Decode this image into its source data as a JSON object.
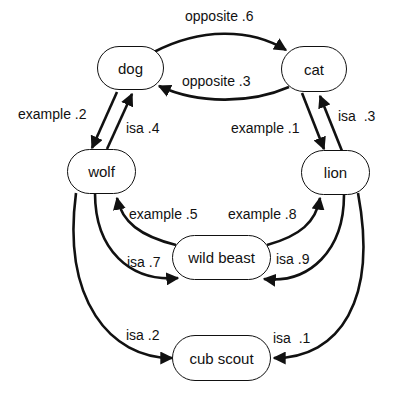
{
  "diagram": {
    "type": "semantic network",
    "nodes": [
      {
        "id": "dog",
        "label": "dog"
      },
      {
        "id": "cat",
        "label": "cat"
      },
      {
        "id": "wolf",
        "label": "wolf"
      },
      {
        "id": "lion",
        "label": "lion"
      },
      {
        "id": "wild_beast",
        "label": "wild beast"
      },
      {
        "id": "cub_scout",
        "label": "cub scout"
      }
    ],
    "edges": [
      {
        "from": "dog",
        "to": "cat",
        "relation": "opposite",
        "weight": ".6",
        "label": "opposite .6"
      },
      {
        "from": "cat",
        "to": "dog",
        "relation": "opposite",
        "weight": ".3",
        "label": "opposite .3"
      },
      {
        "from": "dog",
        "to": "wolf",
        "relation": "example",
        "weight": ".2",
        "label": "example .2"
      },
      {
        "from": "wolf",
        "to": "dog",
        "relation": "isa",
        "weight": ".4",
        "label": "isa .4"
      },
      {
        "from": "cat",
        "to": "lion",
        "relation": "example",
        "weight": ".1",
        "label": "example .1"
      },
      {
        "from": "lion",
        "to": "cat",
        "relation": "isa",
        "weight": ".3",
        "label": "isa  .3"
      },
      {
        "from": "wild_beast",
        "to": "wolf",
        "relation": "example",
        "weight": ".5",
        "label": "example .5"
      },
      {
        "from": "wild_beast",
        "to": "lion",
        "relation": "example",
        "weight": ".8",
        "label": "example .8"
      },
      {
        "from": "wolf",
        "to": "wild_beast",
        "relation": "isa",
        "weight": ".7",
        "label": "isa .7"
      },
      {
        "from": "lion",
        "to": "wild_beast",
        "relation": "isa",
        "weight": ".9",
        "label": "isa .9"
      },
      {
        "from": "wolf",
        "to": "cub_scout",
        "relation": "isa",
        "weight": ".2",
        "label": "isa .2"
      },
      {
        "from": "lion",
        "to": "cub_scout",
        "relation": "isa",
        "weight": ".1",
        "label": "isa  .1"
      }
    ]
  }
}
